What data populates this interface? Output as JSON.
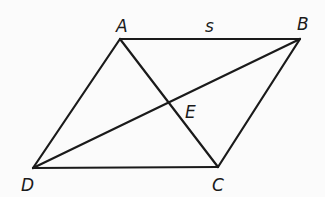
{
  "diagram": {
    "type": "parallelogram-with-diagonals",
    "vertices": {
      "A": {
        "label": "A",
        "x": 120,
        "y": 39
      },
      "B": {
        "label": "B",
        "x": 300,
        "y": 39
      },
      "C": {
        "label": "C",
        "x": 218,
        "y": 167
      },
      "D": {
        "label": "D",
        "x": 33,
        "y": 168
      }
    },
    "intersection": {
      "label": "E",
      "x": 169,
      "y": 103
    },
    "side_label": {
      "label": "s",
      "side": "AB"
    },
    "edges": [
      "AB",
      "BC",
      "CD",
      "DA"
    ],
    "diagonals": [
      "AC",
      "BD"
    ],
    "stroke_color": "#1a1a1a",
    "background_color": "#fbfbfb"
  },
  "labels": {
    "A": "A",
    "B": "B",
    "C": "C",
    "D": "D",
    "E": "E",
    "s": "s"
  }
}
